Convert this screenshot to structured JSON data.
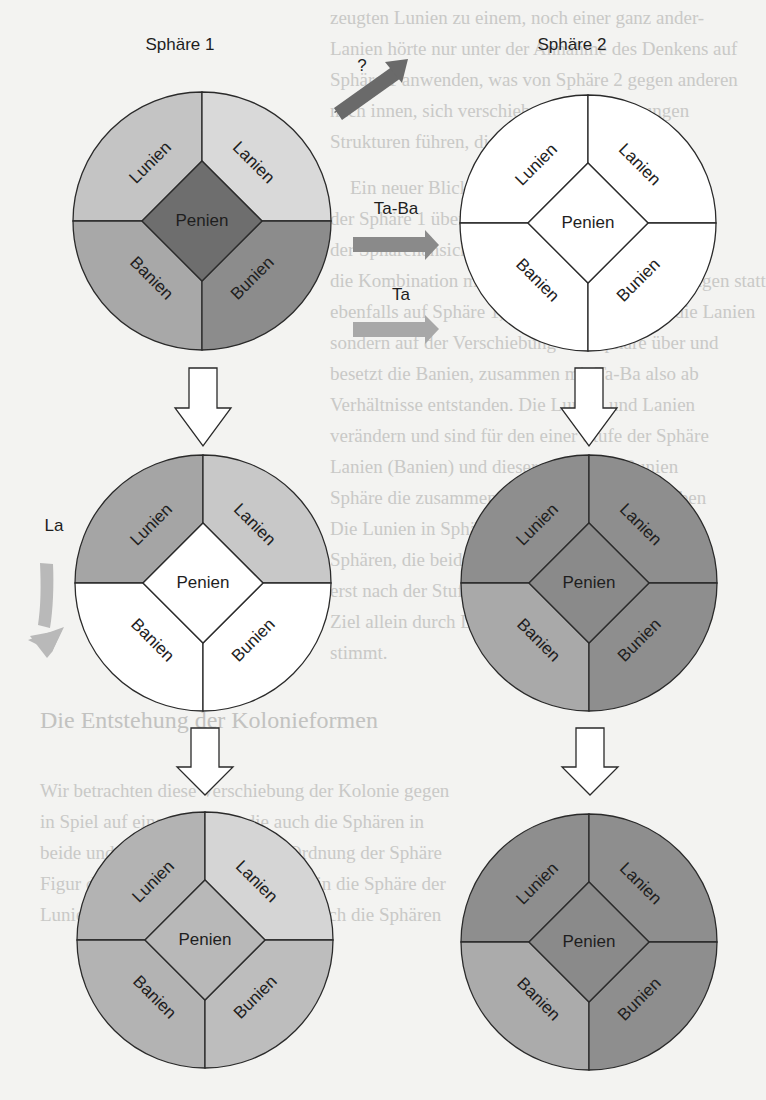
{
  "figure": {
    "labels": {
      "sphere1": "Sphäre 1",
      "sphere2": "Sphäre 2",
      "question": "?",
      "ta_ba": "Ta-Ba",
      "ta": "Ta",
      "la": "La"
    },
    "segment_names": {
      "top_left": "Lunien",
      "top_right": "Lanien",
      "bottom_left": "Banien",
      "bottom_right": "Bunien",
      "center": "Penien"
    },
    "colors": {
      "stroke": "#2a2a2a",
      "arrow_question": "#6a6a6a",
      "arrow_ta_ba": "#8a8a8a",
      "arrow_ta": "#a8a8a8",
      "arrow_la": "#b9b9b9",
      "hollow_arrow_fill": "#ffffff"
    },
    "circles": [
      {
        "id": "sphere1",
        "cx": 202,
        "cy": 221,
        "r": 129,
        "fills": {
          "top_left": "#c4c4c4",
          "top_right": "#d9d9d9",
          "bottom_left": "#a8a8a8",
          "bottom_right": "#8c8c8c",
          "center": "#6e6e6e"
        },
        "center_text": "#f0f0f0"
      },
      {
        "id": "sphere2",
        "cx": 588,
        "cy": 223,
        "r": 128,
        "fills": {
          "top_left": "#ffffff",
          "top_right": "#ffffff",
          "bottom_left": "#ffffff",
          "bottom_right": "#ffffff",
          "center": "#ffffff"
        },
        "center_text": "#1e1e1e"
      },
      {
        "id": "sphere1-after-la",
        "cx": 203,
        "cy": 583,
        "r": 128,
        "fills": {
          "top_left": "#a5a5a5",
          "top_right": "#c8c8c8",
          "bottom_left": "#ffffff",
          "bottom_right": "#ffffff",
          "center": "#ffffff"
        },
        "center_text": "#1e1e1e"
      },
      {
        "id": "sphere2-after",
        "cx": 589,
        "cy": 583,
        "r": 128,
        "fills": {
          "top_left": "#8e8e8e",
          "top_right": "#8e8e8e",
          "bottom_left": "#a9a9a9",
          "bottom_right": "#8e8e8e",
          "center": "#8a8a8a"
        },
        "center_text": "#1e1e1e"
      },
      {
        "id": "sphere1-final",
        "cx": 205,
        "cy": 940,
        "r": 128,
        "fills": {
          "top_left": "#b3b3b3",
          "top_right": "#d5d5d5",
          "bottom_left": "#b3b3b3",
          "bottom_right": "#bdbdbd",
          "center": "#b8b8b8"
        },
        "center_text": "#1e1e1e"
      },
      {
        "id": "sphere2-final",
        "cx": 589,
        "cy": 942,
        "r": 128,
        "fills": {
          "top_left": "#8e8e8e",
          "top_right": "#8e8e8e",
          "bottom_left": "#ababab",
          "bottom_right": "#8e8e8e",
          "center": "#8a8a8a"
        },
        "center_text": "#1e1e1e"
      }
    ]
  },
  "background_text": {
    "lines": [
      "zeugten Lunien zu einem, noch einer ganz ander-",
      "Lanien hörte nur unter der Annahme des Denkens auf",
      "Sphäre 1 anwenden, was von Sphäre 2 gegen anderen",
      "nach innen, sich verschieben, aber Änderungen",
      "Strukturen führen, die das",
      "Ein neuer Blickwinkel auf die Probleme",
      "der Sphäre 1 über die Lunien in diese Art von",
      "der Sphärenansicht, dass diese Struktur ergeben",
      "die Kombination mit der verschiedenen Änderungen statt",
      "ebenfalls auf Sphäre 1, sondern auf Sphäre 2 die Lanien",
      "sondern auf der Verschiebung von Sphäre über und",
      "besetzt die Banien, zusammen mit Ta-Ba also ab",
      "Verhältnisse entstanden. Die Lunien und Lanien",
      "verändern und sind für den einer Stufe der Sphäre",
      "Lanien (Banien) und dieser ganz neue Bunien",
      "Sphäre die zusammen mit den der Lanien bleiben",
      "Die Lunien in Sphäre 1 verändert, die",
      "Sphären, die beide sphären durch das Denken",
      "erst nach der Stufe die Sphären, die beide",
      "Ziel allein durch Drehungen und Verschiebungen",
      "stimmt.",
      "Die Entstehung der Kolonieformen",
      "Wir betrachten diese Verschiebung der Kolonie gegen",
      "in Spiel auf eine Ordnung, die auch die Sphären in",
      "beide und andere Ebenen an der Ordnung der Sphäre",
      "Figur der Lunien und Lanien wurde in die Sphäre der",
      "Lunien, zur weiteren Verschiebung auch die Sphären"
    ]
  }
}
